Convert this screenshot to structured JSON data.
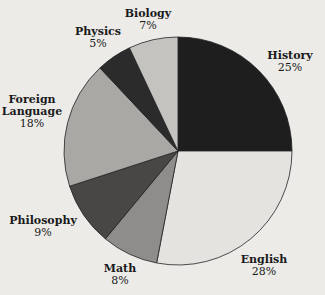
{
  "chart_data": {
    "type": "pie",
    "title": "",
    "start_angle_deg": 0,
    "direction": "clockwise",
    "slices": [
      {
        "label": "History",
        "value": 25,
        "pct_label": "25%",
        "color": "#1e1e1e"
      },
      {
        "label": "English",
        "value": 28,
        "pct_label": "28%",
        "color": "#e4e3e0"
      },
      {
        "label": "Math",
        "value": 8,
        "pct_label": "8%",
        "color": "#8e8d8b"
      },
      {
        "label": "Philosophy",
        "value": 9,
        "pct_label": "9%",
        "color": "#484746"
      },
      {
        "label": "Foreign Language",
        "value": 18,
        "pct_label": "18%",
        "color": "#a9a8a5"
      },
      {
        "label": "Physics",
        "value": 5,
        "pct_label": "5%",
        "color": "#2b2b2b"
      },
      {
        "label": "Biology",
        "value": 7,
        "pct_label": "7%",
        "color": "#c4c3c0"
      }
    ]
  },
  "labels": {
    "history": {
      "name": "History",
      "pct": "25%"
    },
    "english": {
      "name": "English",
      "pct": "28%"
    },
    "math": {
      "name": "Math",
      "pct": "8%"
    },
    "philosophy": {
      "name": "Philosophy",
      "pct": "9%"
    },
    "foreign1": "Foreign",
    "foreign2": "Language",
    "foreign_pct": "18%",
    "physics": {
      "name": "Physics",
      "pct": "5%"
    },
    "biology": {
      "name": "Biology",
      "pct": "7%"
    }
  }
}
